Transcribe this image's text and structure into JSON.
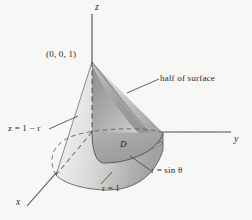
{
  "figure": {
    "kind": "math-3d-solid-diagram",
    "background_color": "#f8f8f6",
    "ink_color": "#2a2a2a",
    "axes": {
      "z_label": "z",
      "y_label": "y",
      "x_label": "x"
    },
    "labels": {
      "apex_point": "(0, 0, 1)",
      "half_of_surface": "half of surface",
      "cone_equation": "z = 1 − r",
      "base_radius": "r = 1",
      "polar_curve": "r = sin θ",
      "region": "D"
    },
    "colors": {
      "surface_light": "#ededeb",
      "surface_mid": "#c9c9c7",
      "surface_dark": "#9d9d9b",
      "region_fill": "#a8a8a6",
      "outline": "#5a5a58"
    }
  }
}
